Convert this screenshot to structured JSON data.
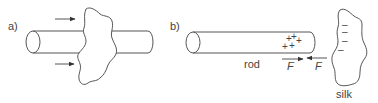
{
  "figure": {
    "panel_a": {
      "label": "a)",
      "objects": [
        "rod",
        "silk"
      ],
      "arrows": 2
    },
    "panel_b": {
      "label": "b)",
      "rod_label": "rod",
      "silk_label": "silk",
      "rod_charges": [
        "+",
        "+",
        "+",
        "+",
        "+"
      ],
      "silk_charges": [
        "–",
        "–",
        "–",
        "–"
      ],
      "force_on_rod_label": "F",
      "force_on_silk_label": "F"
    },
    "colors": {
      "line": "#555555",
      "text": "#444444",
      "background": "#ffffff"
    }
  }
}
